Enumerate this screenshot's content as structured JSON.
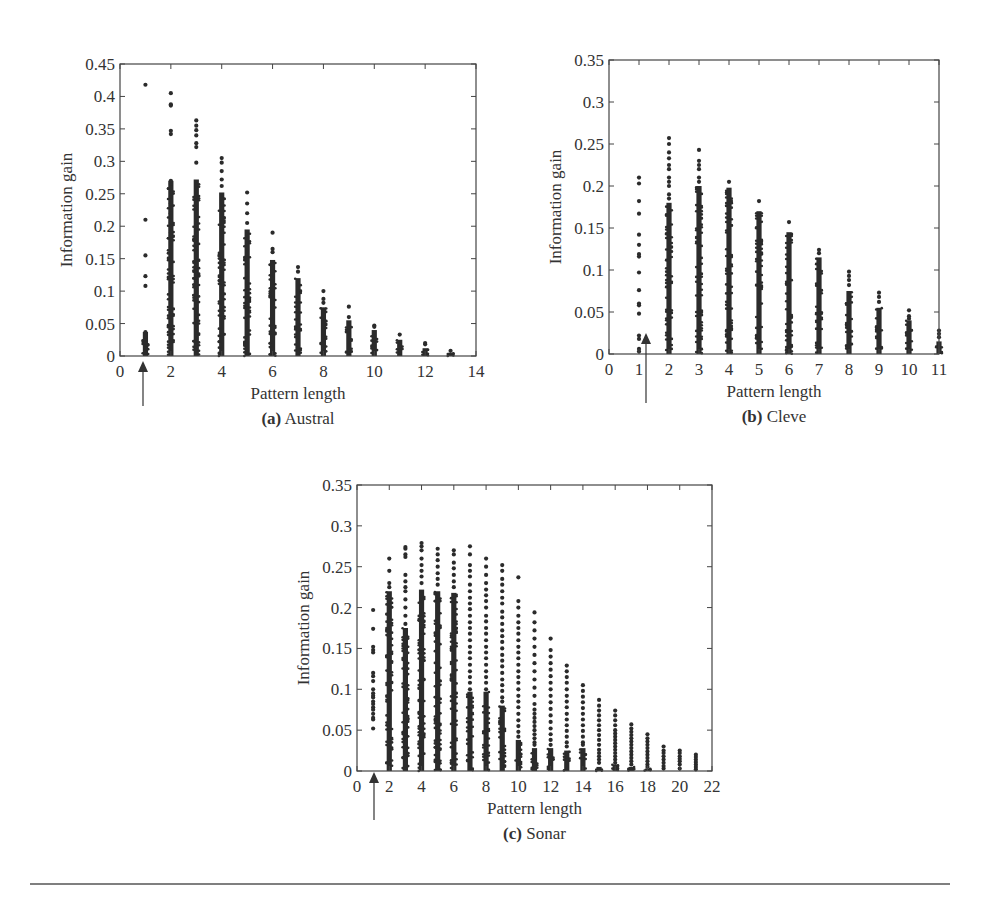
{
  "figure": {
    "divider": {
      "y": 884,
      "x1": 30,
      "x2": 950,
      "color": "#555555"
    },
    "point_color": "#2b2b2b",
    "axis_color": "#444444"
  },
  "chart_data": [
    {
      "id": "a",
      "type": "scatter",
      "caption_prefix": "(a)",
      "caption_name": "Austral",
      "title": "",
      "xlabel": "Pattern length",
      "ylabel": "Information gain",
      "xlim": [
        0,
        14
      ],
      "ylim": [
        0,
        0.45
      ],
      "xticks": [
        0,
        2,
        4,
        6,
        8,
        10,
        12,
        14
      ],
      "xtick_minor": [
        1,
        3,
        5,
        7,
        9,
        11,
        13
      ],
      "yticks": [
        0,
        0.05,
        0.1,
        0.15,
        0.2,
        0.25,
        0.3,
        0.35,
        0.4,
        0.45
      ],
      "ytick_labels": [
        "0",
        "0.05",
        "0.1",
        "0.15",
        "0.2",
        "0.25",
        "0.3",
        "0.35",
        "0.4",
        "0.45"
      ],
      "grid": false,
      "legend": null,
      "box": {
        "left": 120,
        "right": 476,
        "top": 64,
        "bottom": 356
      },
      "annotation": {
        "type": "arrow",
        "x_value": 1,
        "pixel_x": 143,
        "y_tail": 406,
        "y_head": 361
      },
      "columns": [
        {
          "x": 1,
          "max": 0.418,
          "dense_top": 0.037,
          "outliers": [
            0.418,
            0.21,
            0.155,
            0.123,
            0.108,
            0.037,
            0.03,
            0.02,
            0.012,
            0.005
          ]
        },
        {
          "x": 2,
          "max": 0.405,
          "dense_top": 0.27,
          "outliers": [
            0.405,
            0.388,
            0.386,
            0.347,
            0.342,
            0.27,
            0.265,
            0.26,
            0.245,
            0.235,
            0.22,
            0.215,
            0.205,
            0.19,
            0.185,
            0.18
          ]
        },
        {
          "x": 3,
          "max": 0.363,
          "dense_top": 0.272,
          "outliers": [
            0.363,
            0.355,
            0.348,
            0.34,
            0.328,
            0.322,
            0.298
          ]
        },
        {
          "x": 4,
          "max": 0.305,
          "dense_top": 0.252,
          "outliers": [
            0.305,
            0.298,
            0.285,
            0.272,
            0.262
          ]
        },
        {
          "x": 5,
          "max": 0.252,
          "dense_top": 0.195,
          "outliers": [
            0.252,
            0.235,
            0.22,
            0.205
          ]
        },
        {
          "x": 6,
          "max": 0.19,
          "dense_top": 0.148,
          "outliers": [
            0.19,
            0.165,
            0.16
          ]
        },
        {
          "x": 7,
          "max": 0.137,
          "dense_top": 0.12,
          "outliers": [
            0.137,
            0.13
          ]
        },
        {
          "x": 8,
          "max": 0.1,
          "dense_top": 0.075,
          "outliers": [
            0.1,
            0.088,
            0.082
          ]
        },
        {
          "x": 9,
          "max": 0.076,
          "dense_top": 0.055,
          "outliers": [
            0.076,
            0.06
          ]
        },
        {
          "x": 10,
          "max": 0.047,
          "dense_top": 0.04,
          "outliers": [
            0.047,
            0.045
          ]
        },
        {
          "x": 11,
          "max": 0.033,
          "dense_top": 0.025,
          "outliers": [
            0.033
          ]
        },
        {
          "x": 12,
          "max": 0.02,
          "dense_top": 0.012,
          "outliers": [
            0.02,
            0.018
          ]
        },
        {
          "x": 13,
          "max": 0.008,
          "dense_top": 0.005,
          "outliers": [
            0.008
          ]
        }
      ]
    },
    {
      "id": "b",
      "type": "scatter",
      "caption_prefix": "(b)",
      "caption_name": "Cleve",
      "title": "",
      "xlabel": "Pattern length",
      "ylabel": "Information gain",
      "xlim": [
        0,
        11
      ],
      "ylim": [
        0,
        0.35
      ],
      "xticks": [
        0,
        1,
        2,
        3,
        4,
        5,
        6,
        7,
        8,
        9,
        10,
        11
      ],
      "xtick_minor": [],
      "yticks": [
        0,
        0.05,
        0.1,
        0.15,
        0.2,
        0.25,
        0.3,
        0.35
      ],
      "ytick_labels": [
        "0",
        "0.05",
        "0.1",
        "0.15",
        "0.2",
        "0.25",
        "0.3",
        "0.35"
      ],
      "grid": false,
      "legend": null,
      "box": {
        "left": 609,
        "right": 939,
        "top": 60,
        "bottom": 354
      },
      "annotation": {
        "type": "arrow",
        "x_value": 1.4,
        "pixel_x": 646,
        "y_tail": 403,
        "y_head": 333
      },
      "columns": [
        {
          "x": 1,
          "max": 0.21,
          "dense_top": 0.0,
          "outliers": [
            0.21,
            0.203,
            0.182,
            0.167,
            0.142,
            0.13,
            0.119,
            0.116,
            0.097,
            0.076,
            0.06,
            0.058,
            0.048,
            0.022,
            0.018,
            0.006,
            0.003
          ]
        },
        {
          "x": 2,
          "max": 0.257,
          "dense_top": 0.18,
          "outliers": [
            0.257,
            0.25,
            0.24,
            0.233,
            0.225,
            0.22,
            0.21,
            0.205,
            0.2,
            0.19,
            0.185
          ]
        },
        {
          "x": 3,
          "max": 0.243,
          "dense_top": 0.2,
          "outliers": [
            0.243,
            0.23,
            0.225,
            0.22,
            0.21,
            0.205
          ]
        },
        {
          "x": 4,
          "max": 0.205,
          "dense_top": 0.198,
          "outliers": [
            0.205
          ]
        },
        {
          "x": 5,
          "max": 0.182,
          "dense_top": 0.17,
          "outliers": [
            0.182
          ]
        },
        {
          "x": 6,
          "max": 0.157,
          "dense_top": 0.145,
          "outliers": [
            0.157
          ]
        },
        {
          "x": 7,
          "max": 0.124,
          "dense_top": 0.115,
          "outliers": [
            0.124,
            0.12
          ]
        },
        {
          "x": 8,
          "max": 0.098,
          "dense_top": 0.075,
          "outliers": [
            0.098,
            0.093,
            0.088,
            0.082
          ]
        },
        {
          "x": 9,
          "max": 0.073,
          "dense_top": 0.055,
          "outliers": [
            0.073,
            0.068,
            0.062
          ]
        },
        {
          "x": 10,
          "max": 0.052,
          "dense_top": 0.04,
          "outliers": [
            0.052,
            0.045,
            0.042
          ]
        },
        {
          "x": 11,
          "max": 0.028,
          "dense_top": 0.015,
          "outliers": [
            0.028,
            0.024,
            0.02
          ]
        }
      ]
    },
    {
      "id": "c",
      "type": "scatter",
      "caption_prefix": "(c)",
      "caption_name": "Sonar",
      "title": "",
      "xlabel": "Pattern length",
      "ylabel": "Information gain",
      "xlim": [
        0,
        22
      ],
      "ylim": [
        0,
        0.35
      ],
      "xticks": [
        0,
        2,
        4,
        6,
        8,
        10,
        12,
        14,
        16,
        18,
        20,
        22
      ],
      "xtick_minor": [
        1,
        3,
        5,
        7,
        9,
        11,
        13,
        15,
        17,
        19,
        21
      ],
      "yticks": [
        0,
        0.05,
        0.1,
        0.15,
        0.2,
        0.25,
        0.3,
        0.35
      ],
      "ytick_labels": [
        "0",
        "0.05",
        "0.1",
        "0.15",
        "0.2",
        "0.25",
        "0.3",
        "0.35"
      ],
      "grid": false,
      "legend": null,
      "box": {
        "left": 357,
        "right": 712,
        "top": 485,
        "bottom": 771
      },
      "annotation": {
        "type": "arrow",
        "x_value": 1,
        "pixel_x": 374,
        "y_tail": 820,
        "y_head": 772
      },
      "columns": [
        {
          "x": 1,
          "min": 0.052,
          "max": 0.197,
          "dense_top": 0.0,
          "outliers": [
            0.197,
            0.174,
            0.152,
            0.148,
            0.145,
            0.12,
            0.116,
            0.11,
            0.1,
            0.095,
            0.092,
            0.09,
            0.085,
            0.082,
            0.078,
            0.075,
            0.07,
            0.065,
            0.063,
            0.052
          ]
        },
        {
          "x": 2,
          "max": 0.26,
          "dense_top": 0.22,
          "outliers": [
            0.26,
            0.245,
            0.23,
            0.225
          ]
        },
        {
          "x": 3,
          "max": 0.274,
          "dense_top": 0.175,
          "outliers": [
            0.274,
            0.272,
            0.265,
            0.262,
            0.24,
            0.232,
            0.225,
            0.22,
            0.21,
            0.2,
            0.19,
            0.18
          ]
        },
        {
          "x": 4,
          "max": 0.279,
          "dense_top": 0.222,
          "outliers": [
            0.279,
            0.275,
            0.27,
            0.26,
            0.252,
            0.245,
            0.238,
            0.23
          ]
        },
        {
          "x": 5,
          "max": 0.272,
          "dense_top": 0.22,
          "outliers": [
            0.272,
            0.265,
            0.258,
            0.25,
            0.242,
            0.235,
            0.228
          ]
        },
        {
          "x": 6,
          "max": 0.27,
          "dense_top": 0.218,
          "outliers": [
            0.27,
            0.265,
            0.255,
            0.248,
            0.24,
            0.232,
            0.225
          ]
        },
        {
          "x": 7,
          "max": 0.275,
          "dense_top": 0.097,
          "outliers": [
            0.275,
            0.265,
            0.252,
            0.245,
            0.238,
            0.228,
            0.22,
            0.212,
            0.205,
            0.198,
            0.19,
            0.182,
            0.175,
            0.168,
            0.16,
            0.152,
            0.145,
            0.138,
            0.13,
            0.122,
            0.115,
            0.108,
            0.1
          ]
        },
        {
          "x": 8,
          "max": 0.26,
          "dense_top": 0.097,
          "outliers": [
            0.26,
            0.25,
            0.24,
            0.23,
            0.222,
            0.215,
            0.208,
            0.2,
            0.19,
            0.183,
            0.175,
            0.168,
            0.16,
            0.152,
            0.145,
            0.138,
            0.13,
            0.122,
            0.115,
            0.108,
            0.1
          ]
        },
        {
          "x": 9,
          "max": 0.252,
          "dense_top": 0.08,
          "outliers": [
            0.252,
            0.245,
            0.235,
            0.228,
            0.22,
            0.212,
            0.205,
            0.195,
            0.188,
            0.18,
            0.172,
            0.165,
            0.158,
            0.15,
            0.142,
            0.135,
            0.128,
            0.12,
            0.112,
            0.105,
            0.098,
            0.09,
            0.085
          ]
        },
        {
          "x": 10,
          "max": 0.237,
          "dense_top": 0.038,
          "outliers": [
            0.237,
            0.208,
            0.2,
            0.19,
            0.182,
            0.175,
            0.168,
            0.16,
            0.152,
            0.145,
            0.138,
            0.13,
            0.122,
            0.115,
            0.108,
            0.1,
            0.092,
            0.085,
            0.078,
            0.07,
            0.062,
            0.055,
            0.048,
            0.042
          ]
        },
        {
          "x": 11,
          "max": 0.194,
          "dense_top": 0.028,
          "outliers": [
            0.194,
            0.182,
            0.172,
            0.162,
            0.152,
            0.142,
            0.132,
            0.122,
            0.112,
            0.102,
            0.092,
            0.082,
            0.075,
            0.07,
            0.065,
            0.06,
            0.055,
            0.05,
            0.045,
            0.04,
            0.035,
            0.032
          ]
        },
        {
          "x": 12,
          "max": 0.162,
          "dense_top": 0.028,
          "outliers": [
            0.162,
            0.148,
            0.14,
            0.132,
            0.124,
            0.116,
            0.108,
            0.1,
            0.092,
            0.084,
            0.076,
            0.068,
            0.06,
            0.052,
            0.045,
            0.038,
            0.032
          ]
        },
        {
          "x": 13,
          "max": 0.129,
          "dense_top": 0.025,
          "outliers": [
            0.129,
            0.122,
            0.115,
            0.108,
            0.1,
            0.092,
            0.085,
            0.078,
            0.07,
            0.063,
            0.056,
            0.049,
            0.042,
            0.035,
            0.03
          ]
        },
        {
          "x": 14,
          "max": 0.105,
          "dense_top": 0.028,
          "outliers": [
            0.105,
            0.098,
            0.091,
            0.084,
            0.077,
            0.07,
            0.063,
            0.056,
            0.049,
            0.042,
            0.035,
            0.032
          ]
        },
        {
          "x": 15,
          "max": 0.087,
          "dense_top": 0.005,
          "outliers": [
            0.087,
            0.08,
            0.074,
            0.068,
            0.062,
            0.056,
            0.05,
            0.044,
            0.038,
            0.032,
            0.026,
            0.022,
            0.018,
            0.014,
            0.01
          ]
        },
        {
          "x": 16,
          "max": 0.074,
          "dense_top": 0.008,
          "outliers": [
            0.074,
            0.068,
            0.062,
            0.056,
            0.05,
            0.046,
            0.042,
            0.038,
            0.034,
            0.03,
            0.026,
            0.022,
            0.018,
            0.014,
            0.01
          ]
        },
        {
          "x": 17,
          "max": 0.057,
          "dense_top": 0.005,
          "outliers": [
            0.057,
            0.052,
            0.048,
            0.044,
            0.04,
            0.036,
            0.032,
            0.028,
            0.024,
            0.02,
            0.016,
            0.012,
            0.008
          ]
        },
        {
          "x": 18,
          "max": 0.045,
          "dense_top": 0.003,
          "outliers": [
            0.045,
            0.04,
            0.036,
            0.032,
            0.028,
            0.024,
            0.02,
            0.016,
            0.012,
            0.008,
            0.005
          ]
        },
        {
          "x": 19,
          "max": 0.03,
          "dense_top": 0.0,
          "outliers": [
            0.03,
            0.025,
            0.022,
            0.018,
            0.014,
            0.01,
            0.006,
            0.003
          ]
        },
        {
          "x": 20,
          "max": 0.025,
          "dense_top": 0.0,
          "outliers": [
            0.025,
            0.022,
            0.018,
            0.015,
            0.012,
            0.008,
            0.003
          ]
        },
        {
          "x": 21,
          "max": 0.02,
          "dense_top": 0.0,
          "outliers": [
            0.02,
            0.017,
            0.014,
            0.011,
            0.008,
            0.005,
            0.002
          ]
        }
      ]
    }
  ]
}
